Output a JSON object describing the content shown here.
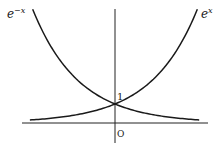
{
  "chart_data": {
    "type": "line",
    "title": "",
    "xlabel": "",
    "ylabel": "",
    "series": [
      {
        "name": "e^x",
        "label_base": "e",
        "label_exp": "x",
        "x": [
          -1.85,
          -1.5,
          -1,
          -0.5,
          0,
          0.5,
          1,
          1.5,
          1.79
        ],
        "values": [
          0.157,
          0.223,
          0.368,
          0.607,
          1,
          1.649,
          2.718,
          4.482,
          6.0
        ]
      },
      {
        "name": "e^-x",
        "label_base": "e",
        "label_exp": "−x",
        "x": [
          -1.79,
          -1.5,
          -1,
          -0.5,
          0,
          0.5,
          1,
          1.5,
          1.83
        ],
        "values": [
          6.0,
          4.482,
          2.718,
          1.649,
          1,
          0.607,
          0.368,
          0.223,
          0.16
        ]
      }
    ],
    "annotations": [
      {
        "text": "1",
        "at": [
          0,
          1
        ]
      },
      {
        "text": "O",
        "at": [
          0,
          0
        ]
      }
    ],
    "xlim": [
      -2.0,
      2.0
    ],
    "ylim": [
      -0.4,
      6.0
    ],
    "grid": false,
    "legend": "inline labels at curve ends"
  },
  "labels": {
    "left_base": "e",
    "left_exp": "−x",
    "right_base": "e",
    "right_exp": "x",
    "one": "1",
    "origin": "O"
  }
}
